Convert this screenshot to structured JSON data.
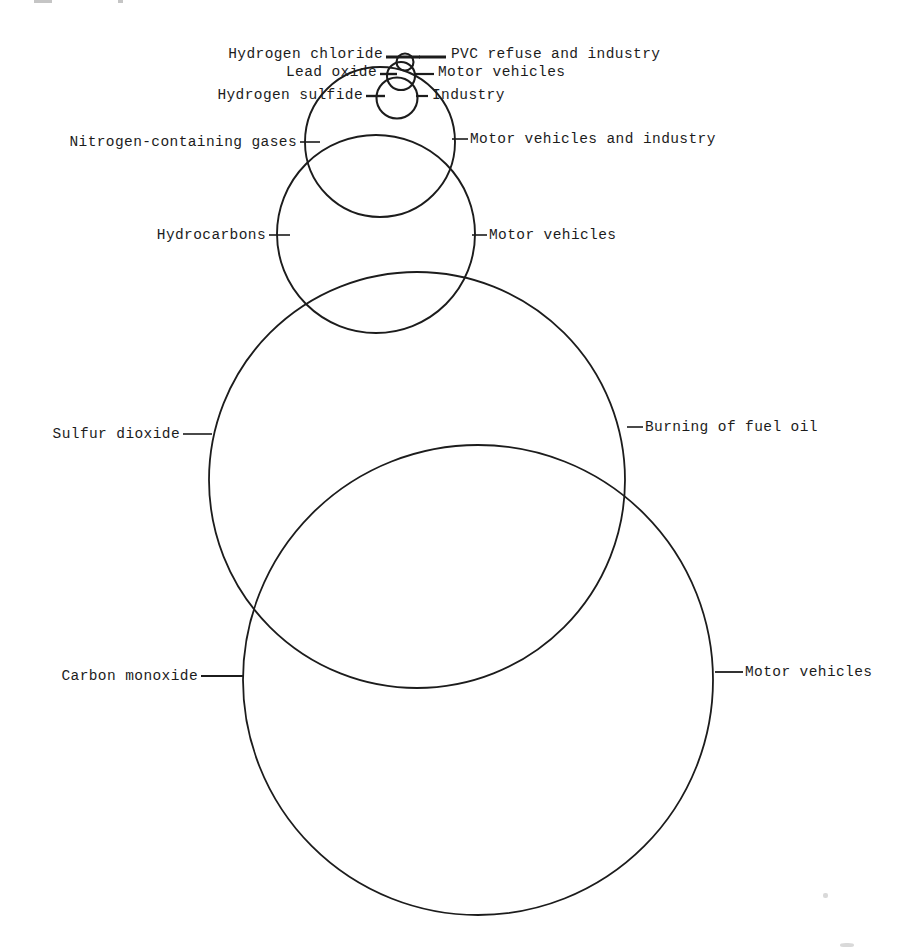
{
  "figure": {
    "type": "proportional-bubble-diagram",
    "stroke_color": "#1c1c1c",
    "background_color": "#ffffff"
  },
  "chart_data": {
    "type": "bubble",
    "title": "",
    "xlabel": "",
    "ylabel": "",
    "note": "Nested/overlapping circles sized in proportion to emitted quantity of each pollutant; each circle is labelled on the left with the pollutant and on the right with its principal source.",
    "bubbles": [
      {
        "pollutant": "Hydrogen chloride",
        "source": "PVC refuse and industry",
        "cx": 405,
        "cy": 62,
        "r": 8.5,
        "relative_area": 0.0013
      },
      {
        "pollutant": "Lead oxide",
        "source": "Motor vehicles",
        "cx": 401,
        "cy": 76,
        "r": 14,
        "relative_area": 0.0036
      },
      {
        "pollutant": "Hydrogen sulfide",
        "source": "Industry",
        "cx": 397,
        "cy": 98,
        "r": 20.5,
        "relative_area": 0.0077
      },
      {
        "pollutant": "Nitrogen-containing gases",
        "source": "Motor vehicles and industry",
        "cx": 380,
        "cy": 142,
        "r": 75,
        "relative_area": 0.103
      },
      {
        "pollutant": "Hydrocarbons",
        "source": "Motor vehicles",
        "cx": 376,
        "cy": 234,
        "r": 99,
        "relative_area": 0.179
      },
      {
        "pollutant": "Sulfur dioxide",
        "source": "Burning of fuel oil",
        "cx": 417,
        "cy": 480,
        "r": 208,
        "relative_area": 0.79
      },
      {
        "pollutant": "Carbon monoxide",
        "source": "Motor vehicles",
        "cx": 478,
        "cy": 680,
        "r": 235,
        "relative_area": 1.0
      }
    ]
  },
  "labels": {
    "left": [
      {
        "text": "Hydrogen chloride",
        "right_px": 383,
        "y_px": 54
      },
      {
        "text": "Lead oxide",
        "right_px": 377,
        "y_px": 72
      },
      {
        "text": "Hydrogen sulfide",
        "right_px": 363,
        "y_px": 95
      },
      {
        "text": "Nitrogen-containing gases",
        "right_px": 297,
        "y_px": 142
      },
      {
        "text": "Hydrocarbons",
        "right_px": 266,
        "y_px": 235
      },
      {
        "text": "Sulfur dioxide",
        "right_px": 180,
        "y_px": 434
      },
      {
        "text": "Carbon monoxide",
        "right_px": 198,
        "y_px": 676
      }
    ],
    "right": [
      {
        "text": "PVC refuse and industry",
        "left_px": 451,
        "y_px": 54
      },
      {
        "text": "Motor vehicles",
        "left_px": 438,
        "y_px": 72
      },
      {
        "text": "Industry",
        "left_px": 432,
        "y_px": 95
      },
      {
        "text": "Motor vehicles and industry",
        "left_px": 470,
        "y_px": 139
      },
      {
        "text": "Motor vehicles",
        "left_px": 489,
        "y_px": 235
      },
      {
        "text": "Burning of fuel oil",
        "left_px": 645,
        "y_px": 427
      },
      {
        "text": "Motor vehicles",
        "left_px": 745,
        "y_px": 672
      }
    ]
  },
  "leaders": {
    "left": [
      {
        "x1": 386,
        "x2": 420,
        "y": 57,
        "width": 3.2
      },
      {
        "x1": 380,
        "x2": 397,
        "y": 74,
        "width": 2.4
      },
      {
        "x1": 366,
        "x2": 385,
        "y": 96,
        "width": 2.4
      },
      {
        "x1": 300,
        "x2": 320,
        "y": 142,
        "width": 1.6
      },
      {
        "x1": 269,
        "x2": 290,
        "y": 235,
        "width": 1.6
      },
      {
        "x1": 183,
        "x2": 212,
        "y": 434,
        "width": 1.6
      },
      {
        "x1": 201,
        "x2": 243,
        "y": 676,
        "width": 1.8
      }
    ],
    "right": [
      {
        "x1": 419,
        "x2": 446,
        "y": 57,
        "width": 3.0
      },
      {
        "x1": 415,
        "x2": 434,
        "y": 74,
        "width": 2.2
      },
      {
        "x1": 416,
        "x2": 428,
        "y": 96,
        "width": 2.2
      },
      {
        "x1": 452,
        "x2": 468,
        "y": 139,
        "width": 1.6
      },
      {
        "x1": 472,
        "x2": 487,
        "y": 235,
        "width": 1.6
      },
      {
        "x1": 627,
        "x2": 643,
        "y": 427,
        "width": 1.6
      },
      {
        "x1": 715,
        "x2": 743,
        "y": 672,
        "width": 1.8
      }
    ]
  }
}
